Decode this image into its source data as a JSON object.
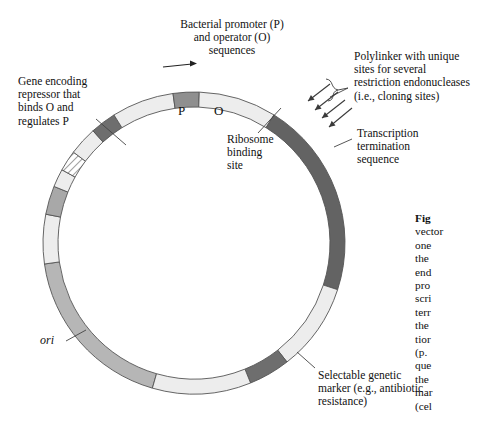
{
  "figure": {
    "title_prefix": "Fig",
    "caption_text": "vector\none\nthe\nend\npro\nscri\nterr\nthe\ntior\n(p.\nque\nthe\nmar\n(cel"
  },
  "labels": {
    "promoter_operator": "Bacterial promoter (P)\nand operator (O)\nsequences",
    "repressor_gene": "Gene encoding\nrepressor that\nbinds O and\nregulates P",
    "polylinker": "Polylinker with unique\nsites for several\nrestriction endonucleases\n(i.e., cloning sites)",
    "transcription_termination": "Transcription\ntermination\nsequence",
    "ribosome_binding": "Ribosome\nbinding\nsite",
    "selectable_marker": "Selectable genetic\nmarker (e.g., antibiotic\nresistance)",
    "origin_of_replication": "ori",
    "promoter_letter": "P",
    "operator_letter": "O"
  },
  "diagram": {
    "type": "plasmid-map",
    "shape": "circle",
    "center_x": 194,
    "center_y": 243,
    "outer_radius": 151,
    "inner_radius": 136,
    "ring_outline_color": "#555555",
    "segments": [
      {
        "name": "repressor-gene",
        "start_deg": 196,
        "end_deg": 262,
        "fill": "#b6b6b6",
        "pattern": "solid"
      },
      {
        "name": "spacer-upper-left",
        "start_deg": 262,
        "end_deg": 281,
        "fill": "#ededed",
        "pattern": "solid"
      },
      {
        "name": "promoter",
        "start_deg": 281,
        "end_deg": 292,
        "fill": "#a8a8a8",
        "pattern": "solid"
      },
      {
        "name": "spacer-promoter-operator",
        "start_deg": 292,
        "end_deg": 299,
        "fill": "#ededed",
        "pattern": "solid"
      },
      {
        "name": "operator",
        "start_deg": 299,
        "end_deg": 307,
        "fill": "#ffffff",
        "pattern": "hatched"
      },
      {
        "name": "spacer-operator-rbs",
        "start_deg": 307,
        "end_deg": 318,
        "fill": "#ededed",
        "pattern": "solid"
      },
      {
        "name": "ribosome-binding-site",
        "start_deg": 318,
        "end_deg": 328,
        "fill": "#6e6e6e",
        "pattern": "solid"
      },
      {
        "name": "polylinker",
        "start_deg": 328,
        "end_deg": 352,
        "fill": "#ededed",
        "pattern": "solid"
      },
      {
        "name": "transcription-termination",
        "start_deg": 352,
        "end_deg": 362,
        "fill": "#8f8f8f",
        "pattern": "solid"
      },
      {
        "name": "spacer-term-marker",
        "start_deg": 362,
        "end_deg": 392,
        "fill": "#ededed",
        "pattern": "solid"
      },
      {
        "name": "selectable-marker",
        "start_deg": 392,
        "end_deg": 468,
        "fill": "#636363",
        "pattern": "solid"
      },
      {
        "name": "spacer-marker-ori",
        "start_deg": 468,
        "end_deg": 502,
        "fill": "#ededed",
        "pattern": "solid"
      },
      {
        "name": "origin-of-replication",
        "start_deg": 502,
        "end_deg": 518,
        "fill": "#6e6e6e",
        "pattern": "solid"
      },
      {
        "name": "spacer-ori-repressor",
        "start_deg": 518,
        "end_deg": 556,
        "fill": "#ededed",
        "pattern": "solid"
      }
    ],
    "transcription_arrow": {
      "name": "transcription-direction-arrow",
      "direction": "clockwise-right",
      "x1": 163,
      "y1": 67,
      "x2": 192,
      "y2": 64
    },
    "polylinker_arrows_count": 4
  },
  "leaders": [
    {
      "name": "leader-repressor",
      "x1": 96,
      "y1": 119,
      "x2": 126,
      "y2": 145
    },
    {
      "name": "leader-polylinker",
      "x1": 348,
      "y1": 88,
      "x2": 330,
      "y2": 97
    },
    {
      "name": "leader-termination",
      "x1": 352,
      "y1": 139,
      "x2": 334,
      "y2": 147
    },
    {
      "name": "leader-ribosome",
      "x1": 258,
      "y1": 133,
      "x2": 281,
      "y2": 108
    },
    {
      "name": "leader-marker",
      "x1": 315,
      "y1": 368,
      "x2": 297,
      "y2": 352
    },
    {
      "name": "leader-ori",
      "x1": 66,
      "y1": 341,
      "x2": 86,
      "y2": 330
    }
  ]
}
